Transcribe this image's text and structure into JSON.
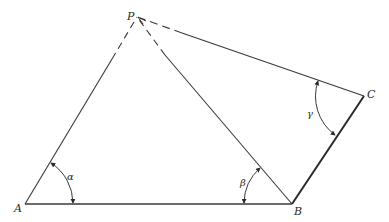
{
  "diagram": {
    "type": "geometry-triangulation",
    "stroke_color": "#3a3a3a",
    "points": {
      "P": {
        "label": "P",
        "x": 137,
        "y": 17
      },
      "A": {
        "label": "A",
        "x": 25,
        "y": 204
      },
      "B": {
        "label": "B",
        "x": 292,
        "y": 204
      },
      "C": {
        "label": "C",
        "x": 364,
        "y": 96
      }
    },
    "segments": [
      {
        "from": "A",
        "to": "B",
        "style": "solid"
      },
      {
        "from": "B",
        "to": "C",
        "style": "solid-thick"
      },
      {
        "from": "A",
        "to": "P",
        "style": "solid-then-dashed-near-P"
      },
      {
        "from": "B",
        "to": "P",
        "style": "solid-then-dashed-near-P"
      },
      {
        "from": "C",
        "to": "P",
        "style": "solid-then-dashed-near-P"
      }
    ],
    "angles": [
      {
        "label": "α",
        "vertex": "A",
        "between": [
          "AP",
          "AB"
        ]
      },
      {
        "label": "β",
        "vertex": "B",
        "between": [
          "BA",
          "BP"
        ]
      },
      {
        "label": "γ",
        "vertex": "C",
        "between": [
          "CP",
          "CB"
        ]
      }
    ]
  }
}
